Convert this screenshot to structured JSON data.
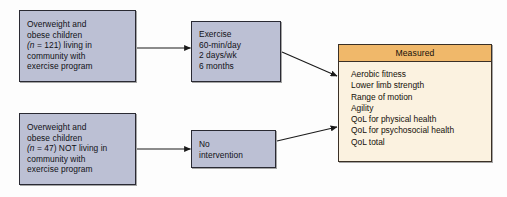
{
  "diagram": {
    "colors": {
      "group_box_fill": "#bcc0d4",
      "group_box_border": "#2a2a33",
      "panel_fill": "#fbf2e0",
      "panel_header_fill": "#f0b86a",
      "panel_border": "#3a3026",
      "arrow": "#1a1a1a",
      "background": "#fdfdfd"
    },
    "nodes": {
      "intervention_group": {
        "lines": [
          "Overweight and",
          "obese children",
          "(n = 121) living in",
          "community with",
          "exercise program"
        ],
        "n": 121
      },
      "control_group": {
        "lines": [
          "Overweight and",
          "obese children",
          "(n = 47) NOT living in",
          "community with",
          "exercise program"
        ],
        "n": 47
      },
      "exercise": {
        "lines": [
          "Exercise",
          "60-min/day",
          "2 days/wk",
          "6 months"
        ]
      },
      "no_intervention": {
        "lines": [
          "No",
          "intervention"
        ]
      }
    },
    "measured_panel": {
      "header": "Measured",
      "items": [
        "Aerobic fitness",
        "Lower limb strength",
        "Range of motion",
        "Agility",
        "QoL for physical health",
        "QoL for psychosocial health",
        "QoL total"
      ]
    },
    "connectors": [
      {
        "name": "intervention-to-exercise",
        "from": "intervention_group",
        "to": "exercise"
      },
      {
        "name": "control-to-no-intervention",
        "from": "control_group",
        "to": "no_intervention"
      },
      {
        "name": "exercise-to-measured",
        "from": "exercise",
        "to": "measured_panel"
      },
      {
        "name": "no-intervention-to-measured",
        "from": "no_intervention",
        "to": "measured_panel"
      }
    ]
  }
}
